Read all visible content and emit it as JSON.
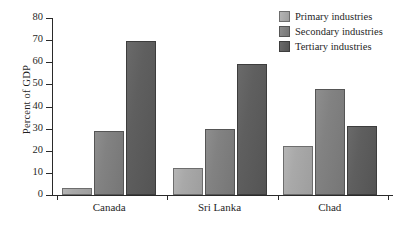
{
  "chart_data": {
    "type": "bar",
    "title": "",
    "subtitle": "",
    "xlabel": "",
    "ylabel": "Percent of GDP",
    "ylim": [
      0,
      80
    ],
    "yticks": [
      0,
      10,
      20,
      30,
      40,
      50,
      60,
      70,
      80
    ],
    "ytick_labels": [
      "0",
      "10",
      "20",
      "30",
      "40",
      "50",
      "60",
      "70",
      "80"
    ],
    "grid": false,
    "legend_position": "top-right",
    "categories": [
      "Canada",
      "Sri Lanka",
      "Chad"
    ],
    "series": [
      {
        "name": "Primary industries",
        "color": "#a9a9a9",
        "values": [
          3,
          12,
          22
        ]
      },
      {
        "name": "Secondary industries",
        "color": "#828282",
        "values": [
          29,
          30,
          48
        ]
      },
      {
        "name": "Tertiary industries",
        "color": "#5f5f5f",
        "values": [
          69.5,
          59,
          31
        ]
      }
    ],
    "annotations": []
  },
  "legend": {
    "items": [
      {
        "label": "Primary industries",
        "swatch": "primary-swatch-icon"
      },
      {
        "label": "Secondary industries",
        "swatch": "secondary-swatch-icon"
      },
      {
        "label": "Tertiary industries",
        "swatch": "tertiary-swatch-icon"
      }
    ]
  }
}
